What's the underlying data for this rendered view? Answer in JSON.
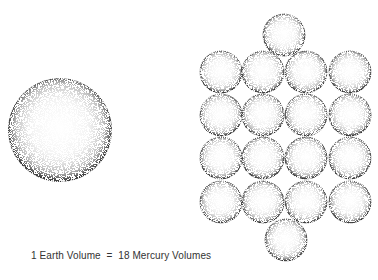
{
  "caption": "1 Earth Volume  =  18 Mercury Volumes",
  "earth": {
    "label": "Earth",
    "cx": 60,
    "cy": 130,
    "r": 52
  },
  "mercury": {
    "label": "Mercury",
    "count": 18,
    "r": 21.5,
    "spheres": [
      {
        "cx": 284,
        "cy": 35
      },
      {
        "cx": 221,
        "cy": 72
      },
      {
        "cx": 263,
        "cy": 72
      },
      {
        "cx": 306,
        "cy": 72
      },
      {
        "cx": 350,
        "cy": 72
      },
      {
        "cx": 221,
        "cy": 115
      },
      {
        "cx": 263,
        "cy": 115
      },
      {
        "cx": 306,
        "cy": 115
      },
      {
        "cx": 350,
        "cy": 115
      },
      {
        "cx": 221,
        "cy": 158
      },
      {
        "cx": 263,
        "cy": 158
      },
      {
        "cx": 306,
        "cy": 158
      },
      {
        "cx": 350,
        "cy": 158
      },
      {
        "cx": 221,
        "cy": 202
      },
      {
        "cx": 263,
        "cy": 202
      },
      {
        "cx": 306,
        "cy": 202
      },
      {
        "cx": 350,
        "cy": 202
      },
      {
        "cx": 286,
        "cy": 240
      }
    ]
  },
  "colors": {
    "stipple": "#1a1a1a",
    "background": "#ffffff"
  }
}
